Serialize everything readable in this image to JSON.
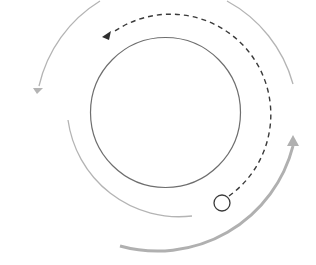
{
  "diagram": {
    "type": "cycle-diagram",
    "colors": {
      "background": "#ffffff",
      "inner_circle": "#6e6e6e",
      "dashed_path": "#3a3a3a",
      "outer_arc_light": "#b4b4b4",
      "outer_arc_thick": "#b0b0b0",
      "start_marker": "#3a3a3a"
    },
    "elements": [
      {
        "id": "central-circle",
        "shape": "circle"
      },
      {
        "id": "dashed-counterclockwise-arrow",
        "shape": "dashed-arc-with-arrowhead",
        "direction": "counterclockwise"
      },
      {
        "id": "start-marker",
        "shape": "small-hollow-circle"
      },
      {
        "id": "outer-top-left-arrow",
        "shape": "arc-with-arrowhead",
        "direction": "counterclockwise"
      },
      {
        "id": "outer-top-right-arc",
        "shape": "arc"
      },
      {
        "id": "lower-left-arc",
        "shape": "arc"
      },
      {
        "id": "bottom-thick-arrow",
        "shape": "thick-arc-with-arrowhead",
        "direction": "counterclockwise"
      }
    ]
  }
}
